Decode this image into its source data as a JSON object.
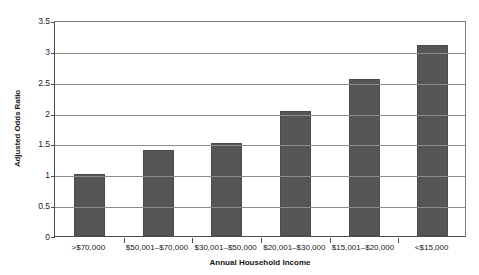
{
  "chart_data": {
    "type": "bar",
    "title": "",
    "categories": [
      ">$70,000",
      "$50,001–$70,000",
      "$30,001–$50,000",
      "$20,001–$30,000",
      "$15,001–$20,000",
      "<$15,000"
    ],
    "values": [
      1.0,
      1.4,
      1.5,
      2.02,
      2.55,
      3.1
    ],
    "xlabel": "Annual Household Income",
    "ylabel": "Adjusted Odds Ratio",
    "ylim": [
      0,
      3.5
    ],
    "yticks": [
      0,
      0.5,
      1,
      1.5,
      2,
      2.5,
      3,
      3.5
    ],
    "ytick_labels": [
      "0",
      "0.5",
      "1",
      "1.5",
      "2",
      "2.5",
      "3",
      "3.5"
    ],
    "grid": true,
    "legend": null,
    "bar_color": "#565656",
    "gridline_color": "#8c8c8c",
    "axis_color": "#4d4d4d"
  }
}
